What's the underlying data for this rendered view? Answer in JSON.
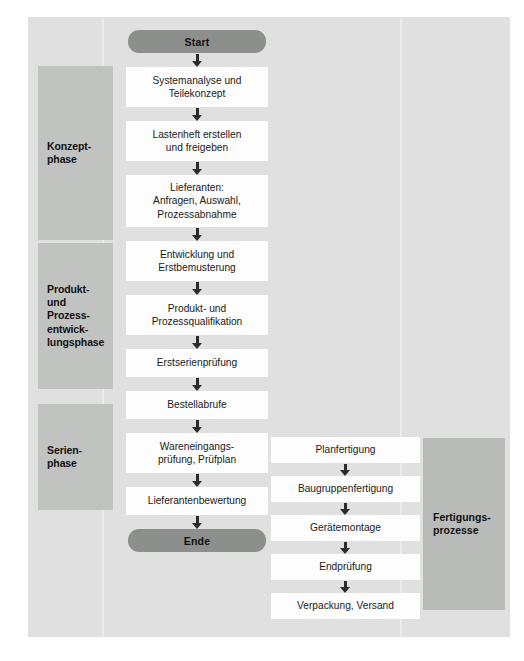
{
  "diagram": {
    "colors": {
      "panel_background": "#dfe0df",
      "phase_band": "#c1c3c1",
      "group_band": "#b9bbb9",
      "terminator": "#8d8f8d",
      "node_fill": "#fdfdfd",
      "connector": "#2b2b2b",
      "text": "#1a1a1a"
    },
    "phases": [
      {
        "id": "konzept",
        "label": "Konzept-\nphase"
      },
      {
        "id": "entwicklung",
        "label": "Produkt-\nund\nProzess-\nentwick-\nlungsphase"
      },
      {
        "id": "serien",
        "label": "Serien-\nphase"
      }
    ],
    "groups": [
      {
        "id": "fertigung",
        "label": "Fertigungs-\nprozesse"
      }
    ],
    "terminators": {
      "start": "Start",
      "end": "Ende"
    },
    "main_flow": [
      {
        "id": "n1",
        "label": "Systemanalyse und\nTeilekonzept"
      },
      {
        "id": "n2",
        "label": "Lastenheft erstellen\nund freigeben"
      },
      {
        "id": "n3",
        "label": "Lieferanten:\nAnfragen, Auswahl,\nProzessabnahme"
      },
      {
        "id": "n4",
        "label": "Entwicklung und\nErstbemusterung"
      },
      {
        "id": "n5",
        "label": "Produkt- und\nProzessqualifikation"
      },
      {
        "id": "n6",
        "label": "Erstserienprüfung"
      },
      {
        "id": "n7",
        "label": "Bestellabrufe"
      },
      {
        "id": "n8",
        "label": "Wareneingangs-\nprüfung, Prüfplan"
      },
      {
        "id": "n9",
        "label": "Lieferantenbewertung"
      }
    ],
    "production_flow": [
      {
        "id": "p1",
        "label": "Planfertigung"
      },
      {
        "id": "p2",
        "label": "Baugruppenfertigung"
      },
      {
        "id": "p3",
        "label": "Gerätemontage"
      },
      {
        "id": "p4",
        "label": "Endprüfung"
      },
      {
        "id": "p5",
        "label": "Verpackung, Versand"
      }
    ]
  }
}
